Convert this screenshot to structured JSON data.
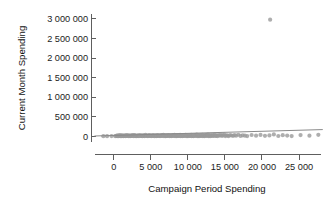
{
  "chart_data": {
    "type": "scatter",
    "title": "",
    "subtitle": "",
    "xlabel": "Campaign Period Spending",
    "ylabel": "Current Month Spending",
    "xlim": [
      -3000,
      28500
    ],
    "ylim": [
      -120000,
      3150000
    ],
    "grid": false,
    "legend": null,
    "xticks": [
      0,
      5000,
      10000,
      15000,
      20000,
      25000
    ],
    "xticklabels": [
      "0",
      "5 000",
      "10 000",
      "15 000",
      "20 000",
      "25 000"
    ],
    "yticks": [
      0,
      500000,
      1000000,
      1500000,
      2000000,
      2500000,
      3000000
    ],
    "yticklabels": [
      "0",
      "500 000",
      "1 000 000",
      "1 500 000",
      "2 000 000",
      "2 500 000",
      "3 000 000"
    ],
    "point_color": "#9a9a9a",
    "line_color": "#8a8a8a",
    "axis_color": "#4d4d4d",
    "annotations": [],
    "trendline": {
      "type": "linear",
      "x_start": -2600,
      "y_start": 8000,
      "x_end": 28200,
      "y_end": 172000
    },
    "series": [
      {
        "name": "observations",
        "points": [
          [
            -1400,
            4000
          ],
          [
            -900,
            2000
          ],
          [
            -300,
            5000
          ],
          [
            200,
            3000
          ],
          [
            320,
            12000
          ],
          [
            450,
            6000
          ],
          [
            520,
            22000
          ],
          [
            610,
            2000
          ],
          [
            700,
            15000
          ],
          [
            780,
            9000
          ],
          [
            850,
            30000
          ],
          [
            930,
            4000
          ],
          [
            1000,
            18000
          ],
          [
            1080,
            7000
          ],
          [
            1150,
            26000
          ],
          [
            1220,
            11000
          ],
          [
            1300,
            3000
          ],
          [
            1380,
            19000
          ],
          [
            1450,
            8000
          ],
          [
            1530,
            24000
          ],
          [
            1600,
            5000
          ],
          [
            1680,
            14000
          ],
          [
            1750,
            31000
          ],
          [
            1830,
            9000
          ],
          [
            1900,
            20000
          ],
          [
            1980,
            6000
          ],
          [
            2050,
            27000
          ],
          [
            2130,
            12000
          ],
          [
            2200,
            4000
          ],
          [
            2280,
            17000
          ],
          [
            2350,
            8000
          ],
          [
            2430,
            23000
          ],
          [
            2500,
            10000
          ],
          [
            2580,
            33000
          ],
          [
            2650,
            5000
          ],
          [
            2730,
            16000
          ],
          [
            2800,
            28000
          ],
          [
            2880,
            7000
          ],
          [
            2950,
            21000
          ],
          [
            3030,
            11000
          ],
          [
            3100,
            3000
          ],
          [
            3180,
            19000
          ],
          [
            3250,
            9000
          ],
          [
            3330,
            25000
          ],
          [
            3400,
            6000
          ],
          [
            3480,
            14000
          ],
          [
            3550,
            30000
          ],
          [
            3630,
            8000
          ],
          [
            3700,
            18000
          ],
          [
            3780,
            12000
          ],
          [
            3850,
            4000
          ],
          [
            3930,
            22000
          ],
          [
            4000,
            10000
          ],
          [
            4080,
            27000
          ],
          [
            4150,
            7000
          ],
          [
            4230,
            16000
          ],
          [
            4300,
            35000
          ],
          [
            4380,
            9000
          ],
          [
            4450,
            20000
          ],
          [
            4530,
            13000
          ],
          [
            4600,
            5000
          ],
          [
            4680,
            24000
          ],
          [
            4750,
            11000
          ],
          [
            4830,
            29000
          ],
          [
            4900,
            8000
          ],
          [
            4980,
            17000
          ],
          [
            5050,
            6000
          ],
          [
            5130,
            21000
          ],
          [
            5200,
            12000
          ],
          [
            5280,
            32000
          ],
          [
            5350,
            9000
          ],
          [
            5430,
            18000
          ],
          [
            5500,
            4000
          ],
          [
            5580,
            26000
          ],
          [
            5650,
            14000
          ],
          [
            5730,
            7000
          ],
          [
            5800,
            23000
          ],
          [
            5880,
            10000
          ],
          [
            5950,
            31000
          ],
          [
            6030,
            8000
          ],
          [
            6100,
            19000
          ],
          [
            6180,
            13000
          ],
          [
            6250,
            5000
          ],
          [
            6330,
            25000
          ],
          [
            6400,
            11000
          ],
          [
            6480,
            28000
          ],
          [
            6550,
            9000
          ],
          [
            6630,
            17000
          ],
          [
            6700,
            36000
          ],
          [
            6780,
            6000
          ],
          [
            6850,
            22000
          ],
          [
            6930,
            12000
          ],
          [
            7000,
            4000
          ],
          [
            7080,
            27000
          ],
          [
            7150,
            15000
          ],
          [
            7230,
            8000
          ],
          [
            7300,
            24000
          ],
          [
            7380,
            10000
          ],
          [
            7450,
            33000
          ],
          [
            7530,
            7000
          ],
          [
            7600,
            20000
          ],
          [
            7680,
            13000
          ],
          [
            7750,
            5000
          ],
          [
            7830,
            26000
          ],
          [
            7900,
            11000
          ],
          [
            7980,
            30000
          ],
          [
            8050,
            9000
          ],
          [
            8130,
            18000
          ],
          [
            8200,
            38000
          ],
          [
            8280,
            6000
          ],
          [
            8350,
            23000
          ],
          [
            8430,
            14000
          ],
          [
            8500,
            4000
          ],
          [
            8580,
            28000
          ],
          [
            8650,
            16000
          ],
          [
            8730,
            8000
          ],
          [
            8800,
            25000
          ],
          [
            8880,
            10000
          ],
          [
            8950,
            34000
          ],
          [
            9030,
            7000
          ],
          [
            9100,
            21000
          ],
          [
            9180,
            12000
          ],
          [
            9250,
            5000
          ],
          [
            9330,
            29000
          ],
          [
            9400,
            13000
          ],
          [
            9480,
            31000
          ],
          [
            9550,
            9000
          ],
          [
            9630,
            19000
          ],
          [
            9700,
            40000
          ],
          [
            9780,
            6000
          ],
          [
            9850,
            24000
          ],
          [
            9930,
            15000
          ],
          [
            10000,
            4000
          ],
          [
            10080,
            27000
          ],
          [
            10150,
            17000
          ],
          [
            10230,
            8000
          ],
          [
            10300,
            26000
          ],
          [
            10380,
            11000
          ],
          [
            10450,
            35000
          ],
          [
            10530,
            7000
          ],
          [
            10600,
            22000
          ],
          [
            10680,
            13000
          ],
          [
            10750,
            5000
          ],
          [
            10830,
            30000
          ],
          [
            10900,
            14000
          ],
          [
            10980,
            32000
          ],
          [
            11050,
            10000
          ],
          [
            11130,
            20000
          ],
          [
            11200,
            42000
          ],
          [
            11280,
            6000
          ],
          [
            11350,
            25000
          ],
          [
            11430,
            16000
          ],
          [
            11500,
            4000
          ],
          [
            11580,
            28000
          ],
          [
            11650,
            18000
          ],
          [
            11730,
            9000
          ],
          [
            11800,
            27000
          ],
          [
            11880,
            12000
          ],
          [
            11950,
            36000
          ],
          [
            12030,
            7000
          ],
          [
            12100,
            23000
          ],
          [
            12180,
            14000
          ],
          [
            12250,
            5000
          ],
          [
            12330,
            31000
          ],
          [
            12400,
            15000
          ],
          [
            12480,
            33000
          ],
          [
            12550,
            11000
          ],
          [
            12630,
            21000
          ],
          [
            12700,
            44000
          ],
          [
            12780,
            6000
          ],
          [
            12850,
            26000
          ],
          [
            12930,
            17000
          ],
          [
            13000,
            4000
          ],
          [
            13100,
            29000
          ],
          [
            13200,
            19000
          ],
          [
            13300,
            10000
          ],
          [
            13400,
            28000
          ],
          [
            13500,
            13000
          ],
          [
            13600,
            38000
          ],
          [
            13700,
            8000
          ],
          [
            13800,
            24000
          ],
          [
            13900,
            15000
          ],
          [
            14000,
            5000
          ],
          [
            14150,
            32000
          ],
          [
            14300,
            16000
          ],
          [
            14450,
            34000
          ],
          [
            14600,
            12000
          ],
          [
            14750,
            22000
          ],
          [
            14900,
            46000
          ],
          [
            15050,
            7000
          ],
          [
            15200,
            27000
          ],
          [
            15350,
            18000
          ],
          [
            15500,
            5000
          ],
          [
            15700,
            30000
          ],
          [
            15900,
            20000
          ],
          [
            16100,
            11000
          ],
          [
            16300,
            29000
          ],
          [
            16500,
            14000
          ],
          [
            16800,
            40000
          ],
          [
            17100,
            9000
          ],
          [
            17400,
            25000
          ],
          [
            17700,
            16000
          ],
          [
            18000,
            6000
          ],
          [
            18600,
            33000
          ],
          [
            19200,
            17000
          ],
          [
            19800,
            36000
          ],
          [
            20400,
            13000
          ],
          [
            21000,
            23000
          ],
          [
            21600,
            48000
          ],
          [
            22200,
            8000
          ],
          [
            22800,
            28000
          ],
          [
            23400,
            19000
          ],
          [
            24000,
            6000
          ],
          [
            25200,
            31000
          ],
          [
            26400,
            15000
          ],
          [
            27600,
            38000
          ],
          [
            21100,
            2980000
          ]
        ]
      }
    ]
  },
  "axes": {
    "x_title": "Campaign Period Spending",
    "y_title": "Current Month Spending"
  }
}
